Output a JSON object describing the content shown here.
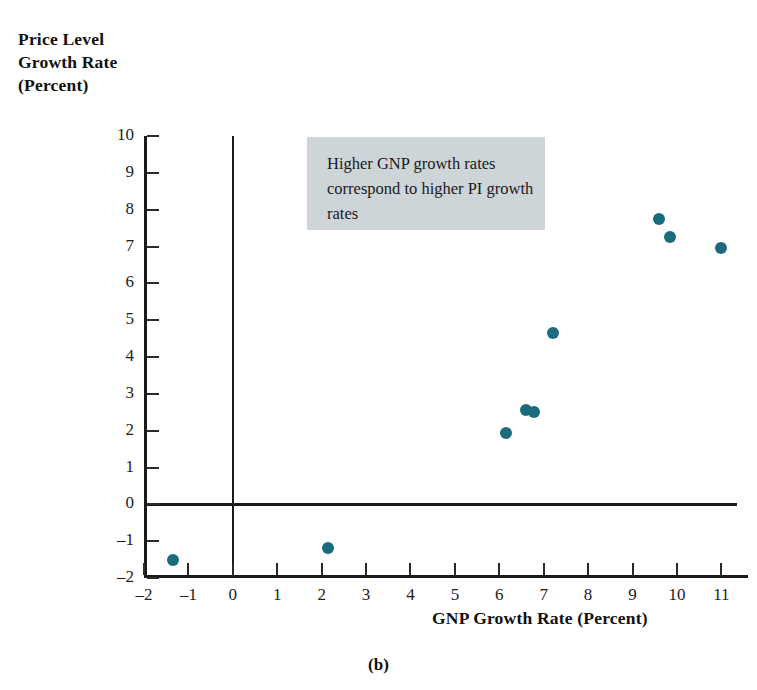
{
  "caption": "(b)",
  "annotation": {
    "text": "Higher GNP growth rates correspond to higher PI growth rates",
    "background_color": "#ced5d8"
  },
  "chart_data": {
    "type": "scatter",
    "title": "",
    "xlabel": "GNP Growth Rate (Percent)",
    "ylabel": "Price Level Growth Rate (Percent)",
    "ylabel_lines": [
      "Price Level",
      "Growth Rate",
      "(Percent)"
    ],
    "xlim": [
      -2,
      11.6
    ],
    "ylim": [
      -2,
      10
    ],
    "xticks": [
      -2,
      -1,
      0,
      1,
      2,
      3,
      4,
      5,
      6,
      7,
      8,
      9,
      10,
      11
    ],
    "yticks": [
      -2,
      -1,
      0,
      1,
      2,
      3,
      4,
      5,
      6,
      7,
      8,
      9,
      10
    ],
    "xtick_labels": [
      "–2",
      "–1",
      "0",
      "1",
      "2",
      "3",
      "4",
      "5",
      "6",
      "7",
      "8",
      "9",
      "10",
      "11"
    ],
    "ytick_labels": [
      "–2",
      "–1",
      "0",
      "1",
      "2",
      "3",
      "4",
      "5",
      "6",
      "7",
      "8",
      "9",
      "10"
    ],
    "grid": false,
    "legend": null,
    "marker_color": "#1a6b7d",
    "zero_lines": {
      "x": 0,
      "y": 0
    },
    "annotations": [
      {
        "text": "Higher GNP growth rates correspond to higher PI growth rates",
        "x_range": [
          3.95,
          9.65
        ],
        "y_range": [
          7.55,
          10.0
        ]
      }
    ],
    "points": [
      {
        "x": -1.35,
        "y": -1.52
      },
      {
        "x": 2.15,
        "y": -1.18
      },
      {
        "x": 6.15,
        "y": 1.95
      },
      {
        "x": 6.6,
        "y": 2.55
      },
      {
        "x": 6.78,
        "y": 2.5
      },
      {
        "x": 7.2,
        "y": 4.65
      },
      {
        "x": 9.6,
        "y": 7.75
      },
      {
        "x": 9.85,
        "y": 7.25
      },
      {
        "x": 11.0,
        "y": 6.95
      }
    ]
  }
}
